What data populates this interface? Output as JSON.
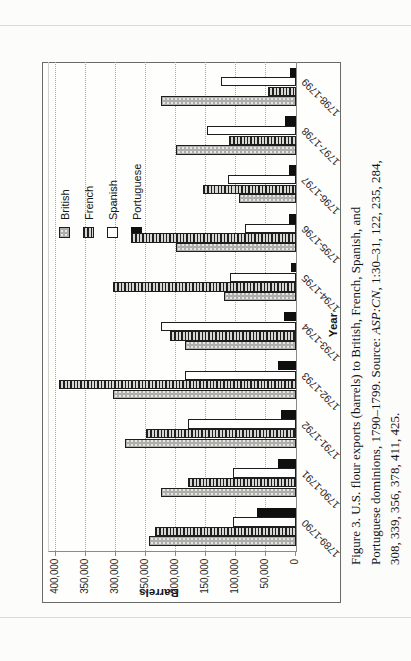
{
  "page": {
    "type": "scanned-book-page-with-rotated-figure",
    "caption": {
      "line1": "Figure 3. U.S. flour exports (barrels) to British, French, Spanish, and",
      "line2_pre": "Portuguese dominions, 1790–1799. Source: ",
      "line2_italic": "ASP:CN",
      "line2_post": ", 1:30–31, 122, 235, 284,",
      "line3": "308, 339, 356, 378, 411, 425."
    }
  },
  "chart_data": {
    "type": "bar",
    "title": "",
    "xlabel": "Year",
    "ylabel": "Barrels",
    "ylim": [
      0,
      400000
    ],
    "ytick_interval": 50000,
    "ytick_labels": [
      "0",
      "50,000",
      "100,000",
      "150,000",
      "200,000",
      "250,000",
      "300,000",
      "350,000",
      "400,000"
    ],
    "grid": "dotted major gridlines, on",
    "legend_position": "inside plot, upper right",
    "rotation_on_page_deg": -90,
    "categories": [
      "1789-1790",
      "1790-1791",
      "1791-1792",
      "1792-1793",
      "1793-1794",
      "1794-1795",
      "1795-1796",
      "1796-1797",
      "1797-1798",
      "1798-1799"
    ],
    "series": [
      {
        "name": "British",
        "pattern": "gray-dotted",
        "values": [
          245000,
          225000,
          285000,
          305000,
          185000,
          120000,
          200000,
          95000,
          200000,
          225000
        ]
      },
      {
        "name": "French",
        "pattern": "dark-hatched",
        "values": [
          235000,
          180000,
          250000,
          395000,
          210000,
          305000,
          275000,
          155000,
          112000,
          46000
        ]
      },
      {
        "name": "Spanish",
        "pattern": "white",
        "values": [
          105000,
          105000,
          180000,
          185000,
          225000,
          110000,
          85000,
          113000,
          148000,
          125000
        ]
      },
      {
        "name": "Portuguese",
        "pattern": "solid-black",
        "values": [
          65000,
          30000,
          25000,
          30000,
          20000,
          8000,
          12000,
          12000,
          18000,
          10000
        ]
      }
    ],
    "colors": {
      "british_fill": "#aeaeab",
      "french_stripe": "#1f1f1f",
      "spanish_fill": "#ffffff",
      "portuguese_fill": "#0f0f0f",
      "bar_border": "#1d1d1d"
    }
  }
}
